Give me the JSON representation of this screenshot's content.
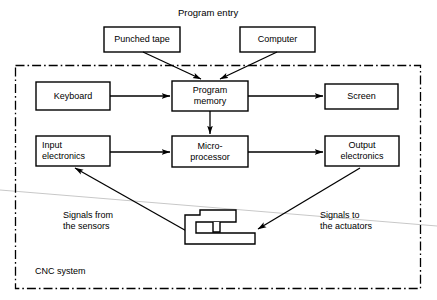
{
  "diagram": {
    "title": "Program entry",
    "container_label": "CNC system",
    "boxes": [
      {
        "id": "punched-tape",
        "label": "Punched tape",
        "x": 104,
        "y": 27,
        "w": 76,
        "h": 25,
        "align": "center"
      },
      {
        "id": "computer",
        "label": "Computer",
        "x": 240,
        "y": 27,
        "w": 75,
        "h": 25,
        "align": "center"
      },
      {
        "id": "keyboard",
        "label": "Keyboard",
        "x": 36,
        "y": 82,
        "w": 74,
        "h": 28,
        "align": "center"
      },
      {
        "id": "program-memory",
        "label": "Program\nmemory",
        "x": 172,
        "y": 81,
        "w": 76,
        "h": 30,
        "align": "center"
      },
      {
        "id": "screen",
        "label": "Screen",
        "x": 325,
        "y": 84,
        "w": 73,
        "h": 25,
        "align": "center"
      },
      {
        "id": "input-electronics",
        "label": "Input\nelectronics",
        "x": 36,
        "y": 136,
        "w": 74,
        "h": 30,
        "align": "left"
      },
      {
        "id": "microprocessor",
        "label": "Micro-\nprocessor",
        "x": 172,
        "y": 136,
        "w": 76,
        "h": 31,
        "align": "center"
      },
      {
        "id": "output-electronics",
        "label": "Output\nelectronics",
        "x": 325,
        "y": 136,
        "w": 74,
        "h": 30,
        "align": "center"
      }
    ],
    "annotations": [
      {
        "id": "signals-from-sensors",
        "label": "Signals from\nthe sensors",
        "x": 63,
        "y": 210
      },
      {
        "id": "signals-to-actuators",
        "label": "Signals to\nthe actuators",
        "x": 320,
        "y": 210
      }
    ],
    "colors": {
      "ink": "#000000",
      "background": "#ffffff",
      "artifact": "#c8c8c8"
    }
  }
}
